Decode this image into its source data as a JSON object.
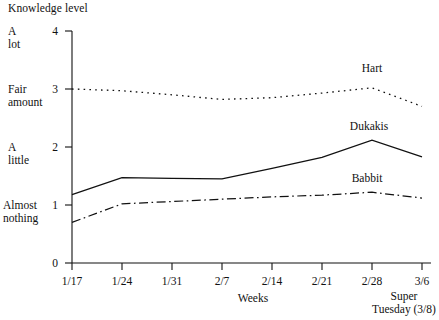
{
  "chart_data": {
    "type": "line",
    "title": "Knowledge level",
    "xlabel": "Weeks",
    "ylabel": "Knowledge level",
    "categories": [
      "1/17",
      "1/24",
      "1/31",
      "2/7",
      "2/14",
      "2/21",
      "2/28",
      "3/6"
    ],
    "ylim": [
      0,
      4
    ],
    "yticks": [
      0,
      1,
      2,
      3,
      4
    ],
    "ytick_labels": [
      "0",
      "1",
      "2",
      "3",
      "4"
    ],
    "ycategory_labels": [
      {
        "value": 4,
        "line1": "A",
        "line2": "lot"
      },
      {
        "value": 3,
        "line1": "Fair",
        "line2": "amount"
      },
      {
        "value": 2,
        "line1": "A",
        "line2": "little"
      },
      {
        "value": 1,
        "line1": "Almost",
        "line2": "nothing"
      }
    ],
    "grid": false,
    "legend_position": "inline-labels",
    "annotations": [
      {
        "text": "Super",
        "at": "3/6"
      },
      {
        "text": "Tuesday (3/8)",
        "at": "3/6"
      }
    ],
    "series": [
      {
        "name": "Hart",
        "style": "dotted",
        "values": [
          3.0,
          2.97,
          2.9,
          2.82,
          2.85,
          2.93,
          3.02,
          2.7
        ]
      },
      {
        "name": "Dukakis",
        "style": "solid",
        "values": [
          1.18,
          1.47,
          1.46,
          1.45,
          1.63,
          1.82,
          2.12,
          1.83
        ]
      },
      {
        "name": "Babbit",
        "style": "dash-dot",
        "values": [
          0.7,
          1.02,
          1.06,
          1.1,
          1.14,
          1.17,
          1.22,
          1.12
        ]
      }
    ]
  },
  "axis": {
    "x_name": "Weeks",
    "event_line1": "Super",
    "event_line2": "Tuesday (3/8)"
  },
  "colors": {
    "ink": "#111111",
    "background": "#ffffff"
  }
}
